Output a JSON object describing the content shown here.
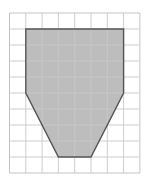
{
  "diagram": {
    "type": "grid-polygon",
    "grid": {
      "columns": 8,
      "rows": 10,
      "origin_px": [
        9.5,
        13
      ],
      "cell_w_px": 16.3,
      "cell_h_px": 16,
      "line_color": "#c8c8c8",
      "border_color": "#bdbdbd"
    },
    "polygon": {
      "vertices_grid": [
        [
          1,
          1
        ],
        [
          7,
          1
        ],
        [
          7,
          5
        ],
        [
          5,
          9
        ],
        [
          3,
          9
        ],
        [
          1,
          5
        ]
      ],
      "fill_color": "#bdbdbd",
      "stroke_color": "#555555"
    }
  }
}
